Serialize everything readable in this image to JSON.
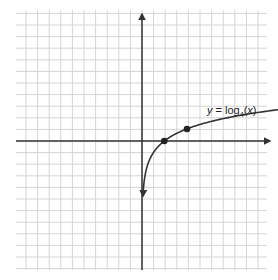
{
  "figure": {
    "type": "function-graph",
    "function_label": {
      "y_var": "y",
      "equals": "=",
      "func": "log",
      "base": "4",
      "arg": "x"
    },
    "colors": {
      "grid": "#d0d0d0",
      "axis": "#333333",
      "curve": "#333333",
      "point": "#222222",
      "background": "#ffffff"
    },
    "marked_points": [
      {
        "x": 1,
        "y": 0
      },
      {
        "x": 4,
        "y": 1
      }
    ],
    "asymptote": "x = 0"
  }
}
